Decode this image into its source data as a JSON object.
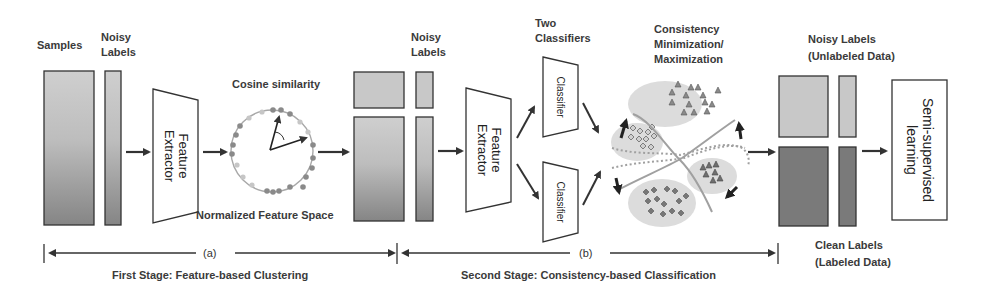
{
  "stage1": {
    "samples_label": "Samples",
    "noisy_labels_line1": "Noisy",
    "noisy_labels_line2": "Labels",
    "feature_extractor_line1": "Feature",
    "feature_extractor_line2": "Extractor",
    "cosine_label": "Cosine similarity",
    "space_label": "Normalized Feature Space",
    "marker": "(a)",
    "caption": "First Stage: Feature-based Clustering"
  },
  "stage2": {
    "noisy_labels_line1": "Noisy",
    "noisy_labels_line2": "Labels",
    "feature_extractor_line1": "Feature",
    "feature_extractor_line2": "Extractor",
    "two_classifiers_line1": "Two",
    "two_classifiers_line2": "Classifiers",
    "classifier_top": "Classifier",
    "classifier_bottom": "Classifier",
    "consistency_line1": "Consistency",
    "consistency_line2": "Minimization/",
    "consistency_line3": "Maximization",
    "marker": "(b)",
    "caption": "Second Stage: Consistency-based Classification"
  },
  "output": {
    "noisy_line1": "Noisy Labels",
    "noisy_line2": "(Unlabeled Data)",
    "clean_line1": "Clean Labels",
    "clean_line2": "(Labeled Data)",
    "ssl_line1": "Semi-supervised",
    "ssl_line2": "learning"
  },
  "colors": {
    "stroke": "#333333",
    "block_light": "#c8c8c8",
    "block_dark": "#7a7a7a",
    "dot_dark": "#8a8a8a",
    "dot_light": "#c4c4c4",
    "cluster_bg": "#dcdcdc",
    "boundary": "#a0a0a0"
  }
}
